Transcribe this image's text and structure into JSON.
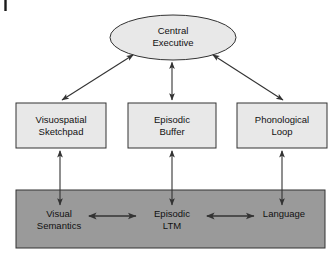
{
  "diagram": {
    "type": "block-diagram",
    "background_color": "#ffffff",
    "colors": {
      "node_fill_light": "#e8e8e8",
      "band_fill_dark": "#9a9a9a",
      "stroke": "#333333",
      "arrow": "#404040",
      "text": "#111111"
    },
    "page_artifact": {
      "name": "page-edge-tick",
      "description": "short vertical black rule at top-left margin"
    },
    "nodes": {
      "central_executive": {
        "label": "Central\nExecutive",
        "shape": "ellipse",
        "fill": "#e8e8e8"
      },
      "visuospatial_sketchpad": {
        "label": "Visuospatial\nSketchpad",
        "shape": "rectangle",
        "fill": "#e8e8e8"
      },
      "episodic_buffer": {
        "label": "Episodic\nBuffer",
        "shape": "rectangle",
        "fill": "#e8e8e8"
      },
      "phonological_loop": {
        "label": "Phonological\nLoop",
        "shape": "rectangle",
        "fill": "#e8e8e8"
      },
      "long_term_band": {
        "label": "",
        "shape": "rectangle",
        "fill": "#9a9a9a"
      },
      "visual_semantics": {
        "label": "Visual\nSemantics",
        "shape": "text",
        "fill": "#9a9a9a"
      },
      "episodic_ltm": {
        "label": "Episodic\nLTM",
        "shape": "text",
        "fill": "#9a9a9a"
      },
      "language": {
        "label": "Language",
        "shape": "text",
        "fill": "#9a9a9a"
      }
    },
    "connectors": [
      {
        "name": "ce-to-visuospatial-sketchpad",
        "from": "central_executive",
        "to": "visuospatial_sketchpad",
        "style": "double-headed",
        "orientation": "diagonal"
      },
      {
        "name": "ce-to-episodic-buffer",
        "from": "central_executive",
        "to": "episodic_buffer",
        "style": "double-headed",
        "orientation": "vertical"
      },
      {
        "name": "ce-to-phonological-loop",
        "from": "central_executive",
        "to": "phonological_loop",
        "style": "double-headed",
        "orientation": "diagonal"
      },
      {
        "name": "visuospatial-sketchpad-to-visual-semantics",
        "from": "visuospatial_sketchpad",
        "to": "visual_semantics",
        "style": "double-headed",
        "orientation": "vertical"
      },
      {
        "name": "episodic-buffer-to-episodic-ltm",
        "from": "episodic_buffer",
        "to": "episodic_ltm",
        "style": "double-headed",
        "orientation": "vertical"
      },
      {
        "name": "phonological-loop-to-language",
        "from": "phonological_loop",
        "to": "language",
        "style": "double-headed",
        "orientation": "vertical"
      },
      {
        "name": "visual-semantics-to-episodic-ltm",
        "from": "visual_semantics",
        "to": "episodic_ltm",
        "style": "double-headed",
        "orientation": "horizontal"
      },
      {
        "name": "episodic-ltm-to-language",
        "from": "episodic_ltm",
        "to": "language",
        "style": "double-headed",
        "orientation": "horizontal"
      }
    ]
  }
}
